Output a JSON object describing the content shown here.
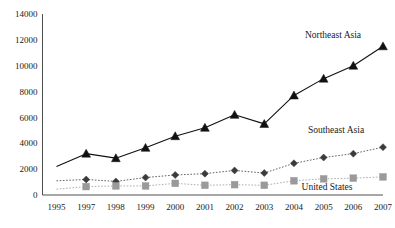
{
  "chart_data": {
    "type": "line",
    "title": "",
    "subtitle": "",
    "xlabel": "",
    "ylabel": "",
    "categories": [
      "1995",
      "1997",
      "1998",
      "1999",
      "2000",
      "2001",
      "2002",
      "2003",
      "2004",
      "2005",
      "2006",
      "2007"
    ],
    "x_tick_labels": [
      "1995",
      "1997",
      "1998",
      "1999",
      "2000",
      "2001",
      "2002",
      "2003",
      "2004",
      "2005",
      "2006",
      "2007"
    ],
    "y_tick_labels": [
      "0",
      "2000",
      "4000",
      "6000",
      "8000",
      "10000",
      "12000",
      "14000"
    ],
    "y_ticks": [
      0,
      2000,
      4000,
      6000,
      8000,
      10000,
      12000,
      14000
    ],
    "ylim": [
      0,
      14000
    ],
    "grid": false,
    "legend_position": "inline-annotations",
    "series": [
      {
        "name": "Northeast Asia",
        "marker": "triangle",
        "color": "#111111",
        "line_style": "solid",
        "label_x": 333,
        "label_y": 38,
        "values": [
          2200,
          3200,
          2850,
          3650,
          4550,
          5200,
          6200,
          5500,
          7700,
          9000,
          10000,
          11500
        ],
        "marker_at_first_point": false
      },
      {
        "name": "Southeast Asia",
        "marker": "diamond",
        "color": "#3b3b3b",
        "line_style": "dotted",
        "label_x": 336,
        "label_y": 133,
        "values": [
          1100,
          1200,
          1050,
          1350,
          1550,
          1650,
          1900,
          1700,
          2450,
          2900,
          3200,
          3700
        ],
        "marker_at_first_point": false
      },
      {
        "name": "United States",
        "marker": "square",
        "color": "#9a9a9a",
        "line_style": "dotted",
        "label_x": 327,
        "label_y": 190,
        "values": [
          450,
          650,
          700,
          700,
          900,
          750,
          800,
          750,
          1100,
          1250,
          1300,
          1400
        ],
        "marker_at_first_point": false
      }
    ]
  },
  "colors": {
    "axis": "#3a3a3a",
    "background": "#ffffff",
    "text": "#1a1a1a",
    "northeast_asia": "#111111",
    "southeast_asia": "#3b3b3b",
    "united_states": "#9a9a9a"
  }
}
